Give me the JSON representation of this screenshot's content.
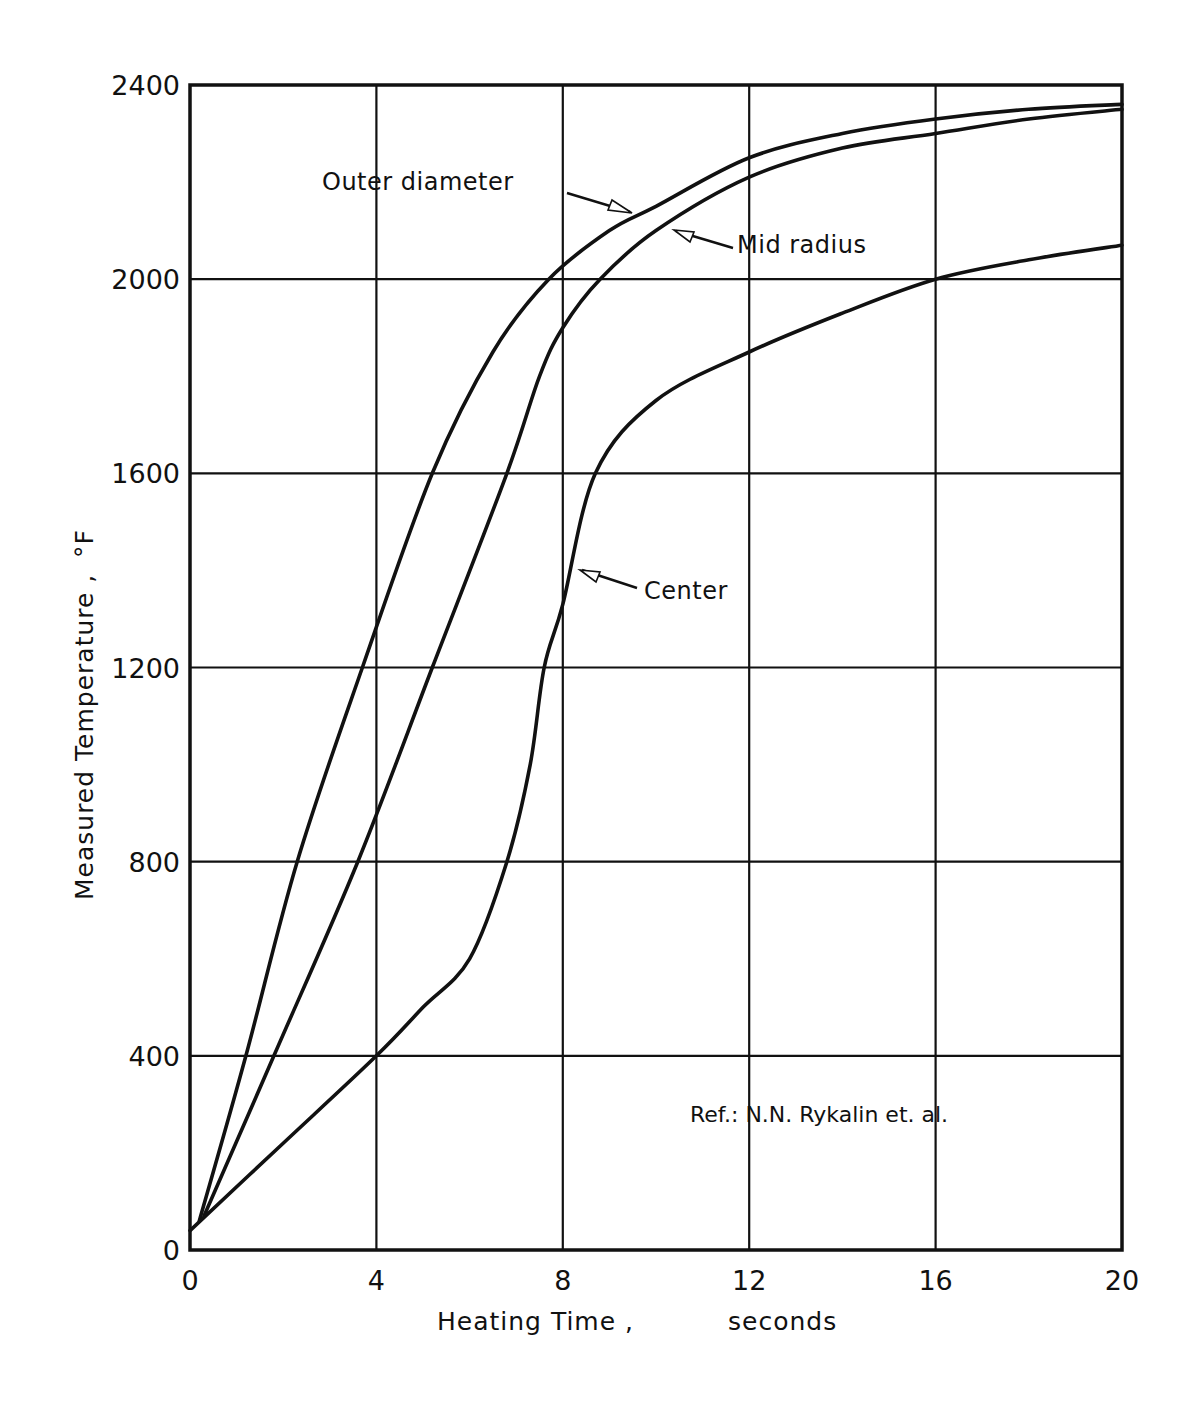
{
  "chart_data": {
    "type": "line",
    "title": "",
    "xlabel": "Heating Time ,    seconds",
    "ylabel": "Measured  Temperature , °F",
    "xlim": [
      0,
      20
    ],
    "ylim": [
      0,
      2400
    ],
    "x_ticks": [
      0,
      4,
      8,
      12,
      16,
      20
    ],
    "y_ticks": [
      0,
      400,
      800,
      1200,
      1600,
      2000,
      2400
    ],
    "x_tick_labels": [
      "0",
      "4",
      "8",
      "12",
      "16",
      "20"
    ],
    "y_tick_labels": [
      "0",
      "400",
      "800",
      "1200",
      "1600",
      "2000",
      "2400"
    ],
    "grid": true,
    "legend_position": "inline annotations with arrows",
    "series": [
      {
        "name": "Outer diameter",
        "x": [
          0.2,
          1.2,
          2.3,
          3.7,
          5.2,
          6.5,
          7.7,
          9.0,
          10.0,
          12.0,
          14.0,
          16.0,
          18.0,
          20.0
        ],
        "values": [
          60,
          400,
          800,
          1200,
          1600,
          1850,
          2000,
          2100,
          2150,
          2250,
          2300,
          2330,
          2350,
          2360
        ]
      },
      {
        "name": "Mid radius",
        "x": [
          0.3,
          1.8,
          3.6,
          5.2,
          6.8,
          7.5,
          8.0,
          8.8,
          10.0,
          12.0,
          14.0,
          16.0,
          18.0,
          20.0
        ],
        "values": [
          70,
          400,
          800,
          1200,
          1600,
          1800,
          1900,
          2000,
          2100,
          2210,
          2270,
          2300,
          2330,
          2350
        ]
      },
      {
        "name": "Center",
        "x": [
          0.0,
          2.0,
          4.0,
          5.0,
          6.0,
          6.8,
          7.3,
          7.6,
          8.0,
          8.7,
          10.0,
          12.0,
          14.0,
          16.0,
          18.0,
          20.0
        ],
        "values": [
          40,
          220,
          400,
          500,
          600,
          800,
          1000,
          1200,
          1330,
          1600,
          1750,
          1850,
          1930,
          2000,
          2040,
          2070
        ]
      }
    ],
    "annotations": [
      {
        "text": "Outer diameter",
        "points_to_x": 9.8,
        "points_to_y": 2160
      },
      {
        "text": "Mid radius",
        "points_to_x": 10.4,
        "points_to_y": 2110
      },
      {
        "text": "Center",
        "points_to_x": 8.2,
        "points_to_y": 1380
      },
      {
        "text": "Ref.:  N.N. Rykalin et. al."
      }
    ]
  },
  "labels": {
    "outer": "Outer diameter",
    "mid": "Mid radius",
    "center": "Center",
    "ref": "Ref.:  N.N. Rykalin et. al.",
    "xlabel_main": "Heating Time ,",
    "xlabel_unit": "seconds",
    "ylabel_main": "Measured  Temperature ,",
    "ylabel_unit": "°F"
  },
  "colors": {
    "ink": "#111111",
    "paper": "#ffffff"
  }
}
